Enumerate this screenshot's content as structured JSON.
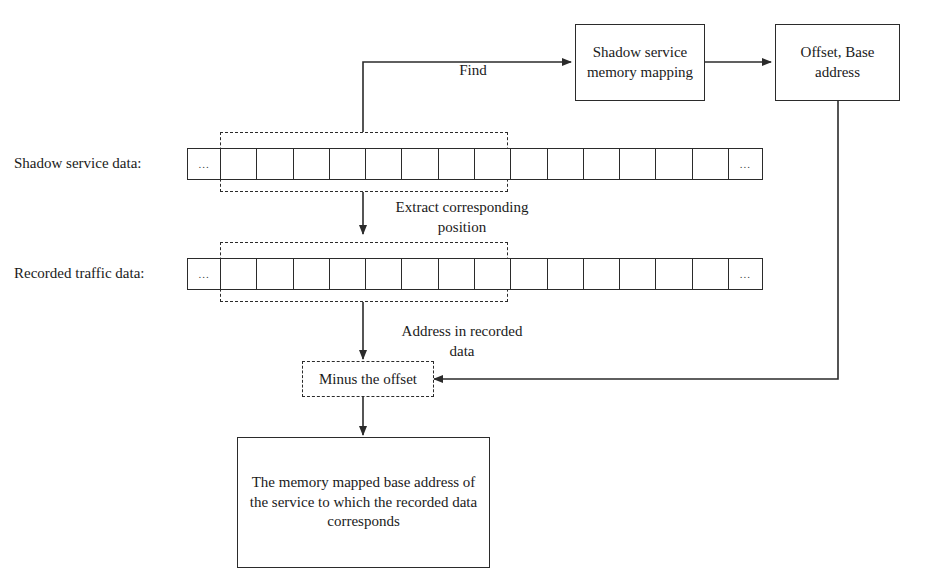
{
  "diagram": {
    "stroke_color": "#2b2b2b",
    "background": "#ffffff"
  },
  "boxes": {
    "shadow_memory_mapping": "Shadow service\nmemory mapping",
    "offset_base_address": "Offset, Base\naddress",
    "minus_the_offset": "Minus the offset",
    "result": "The memory mapped base address\nof the service to which the recorded\ndata corresponds"
  },
  "row_labels": {
    "shadow_service_data": "Shadow service data:",
    "recorded_traffic_data": "Recorded traffic data:"
  },
  "edge_labels": {
    "find": "Find",
    "extract_corresponding_position": "Extract corresponding\nposition",
    "address_in_recorded_data": "Address in recorded\ndata"
  },
  "cell_rows": {
    "shadow_service_data": {
      "cells": [
        "...",
        "",
        "",
        "",
        "",
        "",
        "",
        "",
        "",
        "",
        "",
        "",
        "",
        "",
        "",
        "..."
      ],
      "highlight_from_index": 1,
      "highlight_to_index": 9
    },
    "recorded_traffic_data": {
      "cells": [
        "...",
        "",
        "",
        "",
        "",
        "",
        "",
        "",
        "",
        "",
        "",
        "",
        "",
        "",
        "",
        "..."
      ],
      "highlight_from_index": 1,
      "highlight_to_index": 9
    }
  }
}
